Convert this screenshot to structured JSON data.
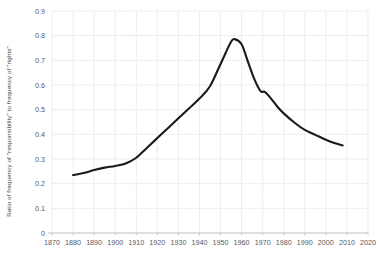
{
  "chart_data": {
    "type": "line",
    "title": "",
    "xlabel": "",
    "ylabel": "Ratio of frequency of \"responsibility\" to frequency of \"rights\"",
    "xlim": [
      1870,
      2020
    ],
    "ylim": [
      0,
      0.9
    ],
    "xticks": [
      1870,
      1880,
      1890,
      1900,
      1910,
      1920,
      1930,
      1940,
      1950,
      1960,
      1970,
      1980,
      1990,
      2000,
      2010,
      2020
    ],
    "yticks": [
      "0",
      "0.1",
      "0.2",
      "0.3",
      "0.4",
      "0.5",
      "0.6",
      "0.7",
      "0.8",
      "0.9"
    ],
    "ytick_values": [
      0,
      0.1,
      0.2,
      0.3,
      0.4,
      0.5,
      0.6,
      0.7,
      0.8,
      0.9
    ],
    "grid": true,
    "legend": "none",
    "line_color": "#1a1a1a",
    "grid_color": "#ededed",
    "series": [
      {
        "name": "ratio",
        "x": [
          1880,
          1885,
          1890,
          1895,
          1900,
          1905,
          1910,
          1915,
          1920,
          1925,
          1930,
          1935,
          1940,
          1945,
          1950,
          1955,
          1957,
          1960,
          1963,
          1966,
          1969,
          1971,
          1974,
          1977,
          1980,
          1985,
          1990,
          1995,
          2000,
          2004,
          2008
        ],
        "values": [
          0.235,
          0.243,
          0.255,
          0.265,
          0.272,
          0.282,
          0.305,
          0.345,
          0.385,
          0.425,
          0.465,
          0.505,
          0.545,
          0.595,
          0.685,
          0.775,
          0.785,
          0.765,
          0.695,
          0.625,
          0.575,
          0.572,
          0.545,
          0.512,
          0.485,
          0.448,
          0.418,
          0.398,
          0.378,
          0.365,
          0.355
        ]
      }
    ]
  }
}
